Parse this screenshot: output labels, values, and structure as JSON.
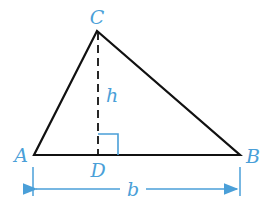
{
  "diagram": {
    "type": "triangle-with-altitude",
    "colors": {
      "outline": "#111111",
      "annotation": "#4a9fd8",
      "background": "#ffffff"
    },
    "vertices": {
      "A": {
        "label": "A",
        "x": 34,
        "y": 155
      },
      "B": {
        "label": "B",
        "x": 240,
        "y": 155
      },
      "C": {
        "label": "C",
        "x": 97,
        "y": 31
      },
      "D": {
        "label": "D",
        "x": 98,
        "y": 155
      }
    },
    "altitude": {
      "label": "h",
      "from": "C",
      "to": "D",
      "style": "dashed"
    },
    "right_angle_marker": {
      "at": "D",
      "size": 20
    },
    "base_dimension": {
      "label": "b",
      "from": "A",
      "to": "B"
    }
  }
}
